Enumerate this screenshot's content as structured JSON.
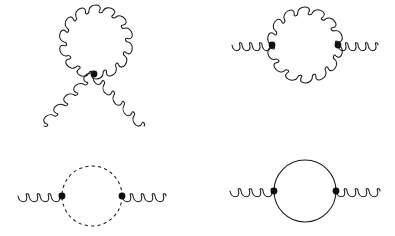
{
  "figure": {
    "background_color": "#ffffff",
    "line_color": "#1a1a1a",
    "vertex_color": "#101010",
    "width": 395,
    "height": 236
  },
  "chart_data": {
    "type": "diagram",
    "panel_count": 4,
    "panels": [
      {
        "id": "gluon-tadpole",
        "label": "Gluon tadpole (four-gluon seagull)",
        "position": "top-left",
        "loop_type": "gluon",
        "loop": {
          "cx": 96,
          "cy": 42,
          "r": 32,
          "coils": 14,
          "amplitude": 5.2
        },
        "vertices": [
          {
            "x": 94,
            "y": 74,
            "r": 3.4,
            "type": "four-gluon"
          }
        ],
        "external_legs": [
          {
            "name": "lower-left-gluon-leg",
            "type": "gluon",
            "from": [
              94,
              74
            ],
            "to": [
              44,
              126
            ],
            "coils": 5,
            "amplitude": 5.2
          },
          {
            "name": "lower-right-gluon-leg",
            "type": "gluon",
            "from": [
              94,
              74
            ],
            "to": [
              144,
              126
            ],
            "coils": 5,
            "amplitude": 5.2
          }
        ]
      },
      {
        "id": "gluon-loop",
        "label": "Gluon loop self-energy",
        "position": "top-right",
        "loop_type": "gluon",
        "loop": {
          "cx": 305,
          "cy": 45,
          "r": 33,
          "coils": 14,
          "amplitude": 5.2
        },
        "vertices": [
          {
            "x": 272,
            "y": 45,
            "r": 3.4,
            "type": "three-gluon"
          },
          {
            "x": 338,
            "y": 45,
            "r": 3.4,
            "type": "three-gluon"
          }
        ],
        "external_legs": [
          {
            "name": "left-gluon-leg",
            "type": "gluon",
            "from": [
              232,
              45
            ],
            "to": [
              272,
              45
            ],
            "coils": 4,
            "amplitude": 5.6
          },
          {
            "name": "right-gluon-leg",
            "type": "gluon",
            "from": [
              338,
              45
            ],
            "to": [
              378,
              45
            ],
            "coils": 4,
            "amplitude": 5.6
          }
        ]
      },
      {
        "id": "ghost-loop",
        "label": "Ghost loop self-energy",
        "position": "bottom-left",
        "loop_type": "ghost",
        "loop": {
          "cx": 92,
          "cy": 196,
          "r": 30,
          "dash": "3.2 3.2"
        },
        "vertices": [
          {
            "x": 62,
            "y": 196,
            "r": 3.4,
            "type": "gluon-ghost"
          },
          {
            "x": 122,
            "y": 196,
            "r": 3.4,
            "type": "gluon-ghost"
          }
        ],
        "external_legs": [
          {
            "name": "left-gluon-leg",
            "type": "gluon",
            "from": [
              18,
              196
            ],
            "to": [
              62,
              196
            ],
            "coils": 4,
            "amplitude": 5.6
          },
          {
            "name": "right-gluon-leg",
            "type": "gluon",
            "from": [
              122,
              196
            ],
            "to": [
              166,
              196
            ],
            "coils": 4,
            "amplitude": 5.6
          }
        ]
      },
      {
        "id": "quark-loop",
        "label": "Quark loop self-energy",
        "position": "bottom-right",
        "loop_type": "quark",
        "loop": {
          "cx": 305,
          "cy": 191,
          "r": 31
        },
        "vertices": [
          {
            "x": 274,
            "y": 191,
            "r": 3.4,
            "type": "quark-gluon"
          },
          {
            "x": 336,
            "y": 191,
            "r": 3.4,
            "type": "quark-gluon"
          }
        ],
        "external_legs": [
          {
            "name": "left-gluon-leg",
            "type": "gluon",
            "from": [
              230,
              191
            ],
            "to": [
              274,
              191
            ],
            "coils": 4,
            "amplitude": 5.6
          },
          {
            "name": "right-gluon-leg",
            "type": "gluon",
            "from": [
              336,
              191
            ],
            "to": [
              380,
              191
            ],
            "coils": 4,
            "amplitude": 5.6
          }
        ]
      }
    ]
  }
}
